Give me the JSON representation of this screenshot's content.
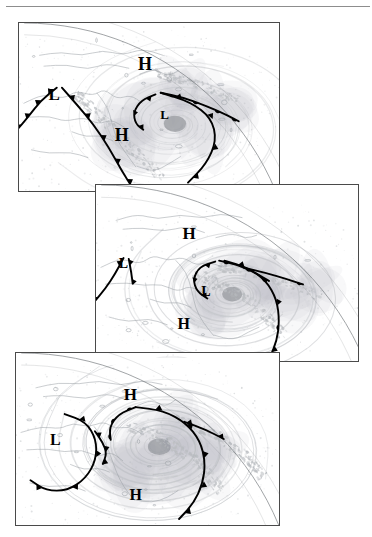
{
  "figure": {
    "type": "satellite-frontal-analysis-sequence",
    "panel_count": 3,
    "top_rule": true
  },
  "panels": [
    {
      "id": "panel-1",
      "stage": "incipient-wave",
      "x": 18,
      "y": 22,
      "w": 260,
      "h": 168,
      "pressure_labels": [
        {
          "text": "H",
          "x": 0.485,
          "y": 0.255,
          "size": 18
        },
        {
          "text": "L",
          "x": 0.135,
          "y": 0.435,
          "size": 17
        },
        {
          "text": "L",
          "x": 0.56,
          "y": 0.555,
          "size": 13
        },
        {
          "text": "H",
          "x": 0.395,
          "y": 0.68,
          "size": 18
        }
      ]
    },
    {
      "id": "panel-2",
      "stage": "deepening-occlusion",
      "x": 95,
      "y": 184,
      "w": 262,
      "h": 176,
      "pressure_labels": [
        {
          "text": "H",
          "x": 0.355,
          "y": 0.285,
          "size": 17
        },
        {
          "text": "L",
          "x": 0.105,
          "y": 0.455,
          "size": 14
        },
        {
          "text": "L",
          "x": 0.42,
          "y": 0.615,
          "size": 14
        },
        {
          "text": "H",
          "x": 0.335,
          "y": 0.795,
          "size": 16
        }
      ]
    },
    {
      "id": "panel-3",
      "stage": "mature-occluded-cyclone",
      "x": 15,
      "y": 352,
      "w": 263,
      "h": 172,
      "pressure_labels": [
        {
          "text": "H",
          "x": 0.435,
          "y": 0.25,
          "size": 17
        },
        {
          "text": "L",
          "x": 0.15,
          "y": 0.515,
          "size": 16
        },
        {
          "text": "H",
          "x": 0.455,
          "y": 0.835,
          "size": 16
        }
      ]
    }
  ],
  "legend_semantics": {
    "cold_front": "solid line with filled triangles",
    "warm_front": "solid line with filled semicircles",
    "occluded_front": "solid line with alternating triangles and semicircles",
    "high_label": "H",
    "low_label": "L"
  },
  "colors": {
    "frame": "#4a4a4a",
    "front_line": "#000000",
    "coastline": "#9aa0a6",
    "cloud": "#b9bcc0",
    "limb": "#6f7478",
    "rule": "#8d8d8d",
    "background": "#ffffff"
  }
}
